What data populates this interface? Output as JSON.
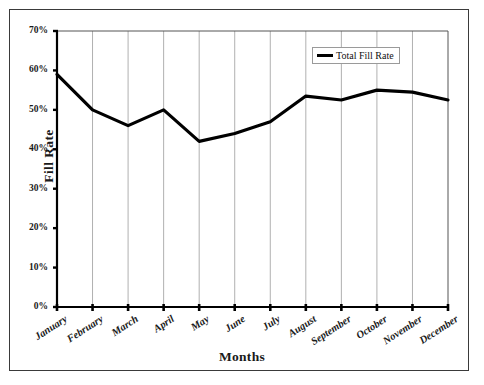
{
  "chart_data": {
    "type": "line",
    "title": "",
    "xlabel": "Months",
    "ylabel": "Fill Rate",
    "categories": [
      "January",
      "February",
      "March",
      "April",
      "May",
      "June",
      "July",
      "August",
      "September",
      "October",
      "November",
      "December"
    ],
    "series": [
      {
        "name": "Total Fill Rate",
        "values": [
          59,
          50,
          46,
          50,
          42,
          44,
          47,
          53.5,
          52.5,
          55,
          54.5,
          52.5
        ]
      }
    ],
    "ylim": [
      0,
      70
    ],
    "y_ticks": [
      0,
      10,
      20,
      30,
      40,
      50,
      60,
      70
    ],
    "y_tick_labels": [
      "0%",
      "10%",
      "20%",
      "30%",
      "40%",
      "50%",
      "60%",
      "70%"
    ],
    "grid": "vertical",
    "legend_position": "top-right-inside",
    "line_color": "#000000",
    "grid_color": "#b0b0b0",
    "axis_color": "#000000"
  },
  "legend": {
    "entries": [
      {
        "label": "Total Fill Rate",
        "color": "#000000"
      }
    ]
  },
  "axes": {
    "y_title": "Fill Rate",
    "x_title": "Months"
  }
}
